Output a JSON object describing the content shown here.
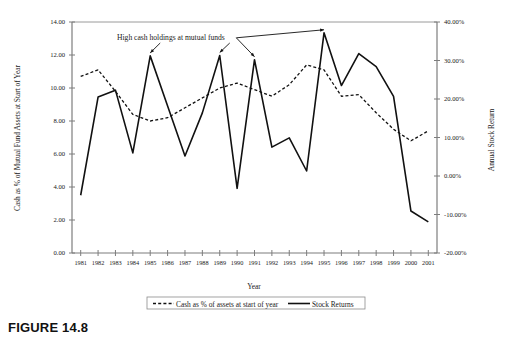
{
  "caption": "FIGURE 14.8",
  "chart_data": {
    "type": "line",
    "title": "",
    "xlabel": "Year",
    "ylabel": "Cash as % of Mutual Fund Assets at Start of Year",
    "y2label": "Annual Stock Return",
    "categories": [
      "1981",
      "1982",
      "1983",
      "1984",
      "1985",
      "1986",
      "1987",
      "1988",
      "1989",
      "1990",
      "1991",
      "1992",
      "1993",
      "1994",
      "1995",
      "1996",
      "1997",
      "1998",
      "1999",
      "2000",
      "2001"
    ],
    "ylim": [
      0.0,
      14.0
    ],
    "yticks": [
      "0.00",
      "2.00",
      "4.00",
      "6.00",
      "8.00",
      "10.00",
      "12.00",
      "14.00"
    ],
    "y2lim": [
      -20.0,
      40.0
    ],
    "y2ticks": [
      "-20.00%",
      "-10.00%",
      "0.00%",
      "10.00%",
      "20.00%",
      "30.00%",
      "40.00%"
    ],
    "grid": false,
    "legend_position": "bottom",
    "series": [
      {
        "name": "Cash as % of assets at start of year",
        "axis": "left",
        "style": "dashed",
        "color": "#111111",
        "values": [
          10.7,
          11.1,
          9.8,
          8.4,
          8.0,
          8.2,
          8.8,
          9.4,
          10.0,
          10.3,
          9.9,
          9.5,
          10.2,
          11.4,
          11.1,
          9.5,
          9.6,
          8.5,
          7.5,
          6.8,
          7.4
        ]
      },
      {
        "name": "Stock Returns",
        "axis": "right",
        "style": "solid",
        "color": "#111111",
        "values": [
          -5.0,
          20.5,
          22.3,
          6.0,
          31.2,
          18.2,
          5.2,
          16.4,
          31.3,
          -3.2,
          30.2,
          7.5,
          9.9,
          1.3,
          37.2,
          23.5,
          31.8,
          28.4,
          20.7,
          -9.1,
          -11.9
        ]
      }
    ],
    "annotation": {
      "text": "High cash holdings at mutual funds",
      "arrow_targets": [
        "1985",
        "1989",
        "1991",
        "1995"
      ]
    },
    "legend": [
      {
        "label": "Cash as % of assets at start of year",
        "style": "dashed"
      },
      {
        "label": "Stock Returns",
        "style": "solid"
      }
    ]
  }
}
